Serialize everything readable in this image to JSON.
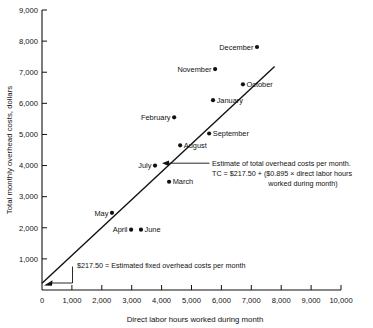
{
  "chart_data": {
    "type": "scatter",
    "title": "",
    "xlabel": "Direct labor hours worked during month",
    "ylabel": "Total monthly overhead costs, dollars",
    "xlim": [
      0,
      10000
    ],
    "ylim": [
      0,
      9000
    ],
    "grid": false,
    "legend": "none",
    "xticks": [
      "0",
      "1,000",
      "2,000",
      "3,000",
      "4,000",
      "5,000",
      "6,000",
      "7,000",
      "8,000",
      "9,000",
      "10,000"
    ],
    "xtick_values": [
      0,
      1000,
      2000,
      3000,
      4000,
      5000,
      6000,
      7000,
      8000,
      9000,
      10000
    ],
    "yticks": [
      "1,000",
      "2,000",
      "3,000",
      "4,000",
      "5,000",
      "6,000",
      "7,000",
      "8,000",
      "9,000"
    ],
    "ytick_values": [
      1000,
      2000,
      3000,
      4000,
      5000,
      6000,
      7000,
      8000,
      9000
    ],
    "points": [
      {
        "label": "May",
        "x": 2340,
        "y": 2480,
        "label_pos": "left"
      },
      {
        "label": "April",
        "x": 2980,
        "y": 1940,
        "label_pos": "left"
      },
      {
        "label": "June",
        "x": 3310,
        "y": 1940,
        "label_pos": "right"
      },
      {
        "label": "July",
        "x": 3780,
        "y": 4000,
        "label_pos": "left"
      },
      {
        "label": "March",
        "x": 4250,
        "y": 3480,
        "label_pos": "right"
      },
      {
        "label": "February",
        "x": 4420,
        "y": 5550,
        "label_pos": "left"
      },
      {
        "label": "August",
        "x": 4620,
        "y": 4650,
        "label_pos": "right"
      },
      {
        "label": "September",
        "x": 5590,
        "y": 5030,
        "label_pos": "right"
      },
      {
        "label": "January",
        "x": 5720,
        "y": 6100,
        "label_pos": "right"
      },
      {
        "label": "November",
        "x": 5790,
        "y": 7100,
        "label_pos": "left"
      },
      {
        "label": "October",
        "x": 6720,
        "y": 6610,
        "label_pos": "right"
      },
      {
        "label": "December",
        "x": 7190,
        "y": 7810,
        "label_pos": "left"
      }
    ],
    "fit_line": {
      "intercept": 217.5,
      "slope": 0.895,
      "x_start": 0,
      "x_end": 7780
    },
    "annotations": [
      {
        "name": "regression-callout",
        "lines": [
          "Estimate of total overhead costs per month.",
          "TC = $217.50 + ($0.895 × direct labor hours",
          "worked during month)"
        ],
        "target_x": 4050,
        "target_y": 3840
      },
      {
        "name": "fixed-cost-callout",
        "lines": [
          "$217.50 = Estimated fixed overhead costs per month"
        ],
        "target_x": 0,
        "target_y": 217.5
      }
    ],
    "colors": {
      "ink": "#111111",
      "background": "#ffffff"
    }
  }
}
